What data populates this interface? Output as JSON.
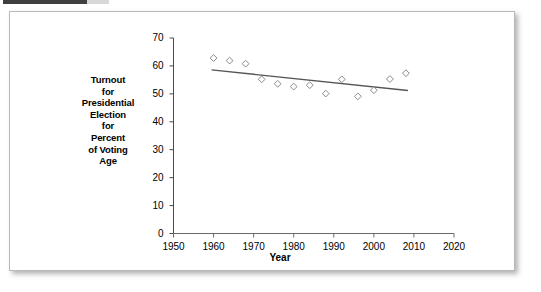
{
  "panel": {
    "top_bar_label": ""
  },
  "chart_data": {
    "type": "scatter",
    "title": "",
    "xlabel": "Year",
    "ylabel": "Turnout for Presidential Election for Percent of Voting Age",
    "ylabel_lines": [
      "Turnout",
      "for",
      "Presidential",
      "Election",
      "for",
      "Percent",
      "of Voting",
      "Age"
    ],
    "xlim": [
      1950,
      2020
    ],
    "ylim": [
      0,
      70
    ],
    "xticks": [
      1950,
      1960,
      1970,
      1980,
      1990,
      2000,
      2010,
      2020
    ],
    "yticks": [
      0,
      10,
      20,
      30,
      40,
      50,
      60,
      70
    ],
    "xtick_labels": [
      "1950",
      "1960",
      "1970",
      "1980",
      "1990",
      "2000",
      "2010",
      "2020"
    ],
    "ytick_labels": [
      "0",
      "10",
      "20",
      "30",
      "40",
      "50",
      "60",
      "70"
    ],
    "grid": false,
    "legend": "none",
    "marker": "open-diamond",
    "marker_color": "#8a8a8a",
    "trendline_color": "#555555",
    "x": [
      1960,
      1964,
      1968,
      1972,
      1976,
      1980,
      1984,
      1988,
      1992,
      1996,
      2000,
      2004,
      2008
    ],
    "values": [
      62.8,
      61.9,
      60.8,
      55.2,
      53.6,
      52.6,
      53.1,
      50.1,
      55.2,
      49.1,
      51.3,
      55.3,
      57.4
    ],
    "series": [
      {
        "name": "Turnout",
        "points": [
          {
            "x": 1960,
            "y": 62.8
          },
          {
            "x": 1964,
            "y": 61.9
          },
          {
            "x": 1968,
            "y": 60.8
          },
          {
            "x": 1972,
            "y": 55.2
          },
          {
            "x": 1976,
            "y": 53.6
          },
          {
            "x": 1980,
            "y": 52.6
          },
          {
            "x": 1984,
            "y": 53.1
          },
          {
            "x": 1988,
            "y": 50.1
          },
          {
            "x": 1992,
            "y": 55.2
          },
          {
            "x": 1996,
            "y": 49.1
          },
          {
            "x": 2000,
            "y": 51.3
          },
          {
            "x": 2004,
            "y": 55.3
          },
          {
            "x": 2008,
            "y": 57.4
          }
        ]
      }
    ],
    "trendline": {
      "type": "linear",
      "x_start": 1959.5,
      "y_start": 58.6,
      "x_end": 2008.5,
      "y_end": 51.2
    }
  }
}
